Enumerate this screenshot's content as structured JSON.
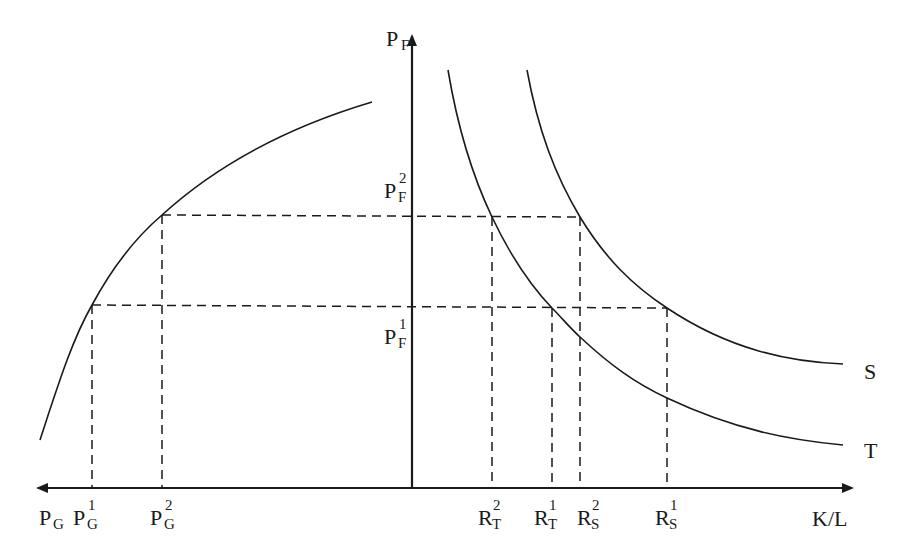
{
  "diagram": {
    "type": "economics-two-quadrant",
    "axes": {
      "vertical": {
        "label_base": "P",
        "label_sub": "F"
      },
      "horizontal_right": {
        "label": "K/L"
      },
      "horizontal_left": {
        "label_base": "P",
        "label_sub": "G"
      }
    },
    "curves": [
      {
        "id": "left-curve",
        "description": "concave increasing curve relating P_G and P_F"
      },
      {
        "id": "S",
        "label": "S"
      },
      {
        "id": "T",
        "label": "T"
      }
    ],
    "vertical_axis_labels": [
      {
        "base": "P",
        "sub": "F",
        "sup": "2"
      },
      {
        "base": "P",
        "sub": "F",
        "sup": "1"
      }
    ],
    "left_axis_labels": [
      {
        "base": "P",
        "sub": "G",
        "sup": ""
      },
      {
        "base": "P",
        "sub": "G",
        "sup": "1"
      },
      {
        "base": "P",
        "sub": "G",
        "sup": "2"
      }
    ],
    "right_axis_labels": [
      {
        "base": "R",
        "sub": "T",
        "sup": "2"
      },
      {
        "base": "R",
        "sub": "T",
        "sup": "1"
      },
      {
        "base": "R",
        "sub": "S",
        "sup": "2"
      },
      {
        "base": "R",
        "sub": "S",
        "sup": "1"
      },
      {
        "base": "K/L",
        "sub": "",
        "sup": ""
      }
    ],
    "curve_labels": {
      "S": "S",
      "T": "T"
    },
    "colors": {
      "line": "#1a1a1a",
      "background": "#ffffff"
    }
  }
}
